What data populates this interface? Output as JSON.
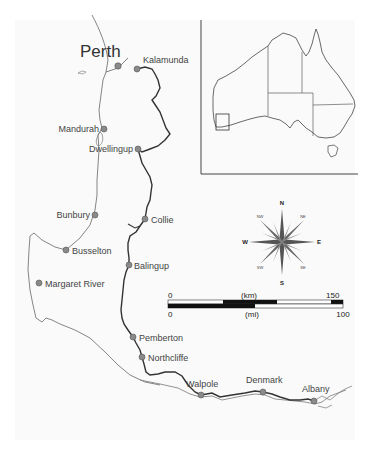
{
  "map": {
    "title": "South-west Western Australia",
    "major_city": {
      "name": "Perth",
      "x": 120,
      "y": 66
    },
    "towns": [
      {
        "name": "Kalamunda",
        "x": 137,
        "y": 69,
        "label_x": 144,
        "label_y": 62,
        "anchor": "start"
      },
      {
        "name": "Mandurah",
        "x": 104,
        "y": 129,
        "label_x": 99,
        "label_y": 132,
        "anchor": "end"
      },
      {
        "name": "Dwellingup",
        "x": 138,
        "y": 149,
        "label_x": 133,
        "label_y": 152,
        "anchor": "end"
      },
      {
        "name": "Bunbury",
        "x": 95,
        "y": 215,
        "label_x": 90,
        "label_y": 218,
        "anchor": "end"
      },
      {
        "name": "Collie",
        "x": 145,
        "y": 219,
        "label_x": 151,
        "label_y": 223,
        "anchor": "start"
      },
      {
        "name": "Busselton",
        "x": 66,
        "y": 250,
        "label_x": 72,
        "label_y": 254,
        "anchor": "start"
      },
      {
        "name": "Balingup",
        "x": 129,
        "y": 265,
        "label_x": 134,
        "label_y": 269,
        "anchor": "start"
      },
      {
        "name": "Margaret River",
        "x": 39,
        "y": 283,
        "label_x": 45,
        "label_y": 287,
        "anchor": "start"
      },
      {
        "name": "Pemberton",
        "x": 133,
        "y": 337,
        "label_x": 139,
        "label_y": 341,
        "anchor": "start"
      },
      {
        "name": "Northcliffe",
        "x": 142,
        "y": 357,
        "label_x": 148,
        "label_y": 361,
        "anchor": "start"
      },
      {
        "name": "Walpole",
        "x": 201,
        "y": 395,
        "label_x": 186,
        "label_y": 387,
        "anchor": "start"
      },
      {
        "name": "Denmark",
        "x": 263,
        "y": 392,
        "label_x": 246,
        "label_y": 383,
        "anchor": "start"
      },
      {
        "name": "Albany",
        "x": 314,
        "y": 401,
        "label_x": 302,
        "label_y": 392,
        "anchor": "start"
      }
    ],
    "marker_color": "#8a8a8a"
  },
  "compass": {
    "north": "N",
    "south": "S",
    "east": "E",
    "west": "W",
    "northeast": "NE",
    "northwest": "NW",
    "southeast": "SE",
    "southwest": "SW"
  },
  "scale_bar": {
    "km_label": "(km)",
    "mi_label": "(mi)",
    "km_start": "0",
    "km_end": "150",
    "mi_start": "0",
    "mi_end": "100"
  },
  "inset": {
    "subject": "Australia",
    "highlight": "study-area-box"
  }
}
